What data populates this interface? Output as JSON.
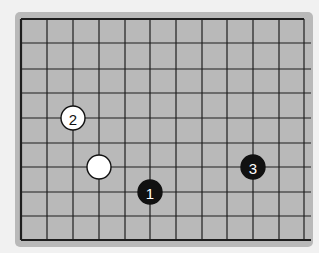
{
  "game": "Go",
  "board": {
    "color": "#b9b9b9",
    "line_color": "#1e1e1e",
    "columns_visible": 12,
    "rows_visible": 10,
    "col_x": [
      21,
      47,
      73,
      99,
      125,
      150,
      176,
      202,
      227,
      253,
      279,
      304
    ],
    "row_y": [
      19,
      43,
      69,
      93,
      118,
      143,
      167,
      192,
      216,
      240
    ],
    "edges": {
      "top": true,
      "left": true,
      "bottom": true,
      "right": false
    }
  },
  "stones": [
    {
      "color": "white",
      "col": 2,
      "row": 4,
      "label": "2"
    },
    {
      "color": "white",
      "col": 3,
      "row": 6,
      "label": ""
    },
    {
      "color": "black",
      "col": 5,
      "row": 7,
      "label": "1"
    },
    {
      "color": "black",
      "col": 9,
      "row": 6,
      "label": "3"
    }
  ]
}
